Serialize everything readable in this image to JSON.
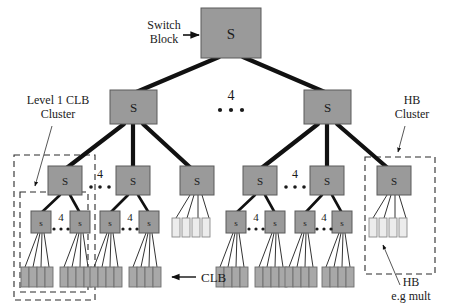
{
  "figure": {
    "background_color": "#ffffff",
    "colors": {
      "switch_block_fill": "#9a9a9a",
      "switch_block_stroke": "#5a5a5a",
      "clb_fill": "#a8a8a8",
      "clb_stroke": "#6e6e6e",
      "hb_fill": "#ececec",
      "hb_stroke": "#8a8a8a",
      "thick_edge": "#111111",
      "thin_edge": "#333333",
      "dashed_box": "#2b2b2b",
      "text": "#1a1a1a"
    }
  },
  "labels": {
    "switch_block": {
      "line1": "Switch",
      "line2": "Block"
    },
    "level1_cluster": {
      "line1": "Level 1 CLB",
      "line2": "Cluster"
    },
    "hb_cluster": {
      "line1": "HB",
      "line2": "Cluster"
    },
    "clb": "CLB",
    "hb_example": {
      "line1": "HB",
      "line2": "e.g mult"
    }
  },
  "fanout_annotations": [
    {
      "id": "root-fanout",
      "value": "4",
      "dots": "3",
      "level": "root-to-level2"
    },
    {
      "id": "l1-left-fanout",
      "value": "4",
      "dots": "3",
      "level": "level2-to-level1"
    },
    {
      "id": "l1-right-fanout",
      "value": "4",
      "dots": "3",
      "level": "level2-to-level1"
    },
    {
      "id": "leaf-c1-fanout",
      "value": "4",
      "dots": "3",
      "level": "level1-to-leaf"
    },
    {
      "id": "leaf-c2-fanout",
      "value": "4",
      "dots": "3",
      "level": "level1-to-leaf"
    },
    {
      "id": "leaf-c3-fanout",
      "value": "4",
      "dots": "3",
      "level": "level1-to-leaf"
    },
    {
      "id": "leaf-c4-fanout",
      "value": "4",
      "dots": "3",
      "level": "level1-to-leaf"
    }
  ],
  "nodes": {
    "switch_block_glyph": "S",
    "leaf_switch_glyph": "s",
    "root": {
      "id": "S-root",
      "glyph": "S"
    },
    "level2": [
      {
        "id": "S-L2-left",
        "glyph": "S"
      },
      {
        "id": "S-L2-right",
        "glyph": "S"
      }
    ],
    "level1": [
      {
        "id": "S-L1-1",
        "glyph": "S",
        "kind": "clb-cluster"
      },
      {
        "id": "S-L1-2",
        "glyph": "S",
        "kind": "clb-cluster"
      },
      {
        "id": "S-L1-3",
        "glyph": "S",
        "kind": "hb-cluster"
      },
      {
        "id": "S-L1-4",
        "glyph": "S",
        "kind": "clb-cluster"
      },
      {
        "id": "S-L1-5",
        "glyph": "S",
        "kind": "clb-cluster"
      },
      {
        "id": "S-L1-6",
        "glyph": "S",
        "kind": "hb-cluster"
      }
    ],
    "leaf_switches": [
      {
        "id": "s-1a",
        "glyph": "s"
      },
      {
        "id": "s-1b",
        "glyph": "s"
      },
      {
        "id": "s-2a",
        "glyph": "s"
      },
      {
        "id": "s-2b",
        "glyph": "s"
      },
      {
        "id": "s-4a",
        "glyph": "s"
      },
      {
        "id": "s-4b",
        "glyph": "s"
      },
      {
        "id": "s-5a",
        "glyph": "s"
      },
      {
        "id": "s-5b",
        "glyph": "s"
      }
    ],
    "clb_groups_count": 8,
    "clbs_per_group": 4,
    "hb_groups_count": 2,
    "hbs_per_group": 4
  },
  "dashed_regions": [
    {
      "id": "level1-clb-cluster-box",
      "label_ref": "level1_cluster"
    },
    {
      "id": "level1-clb-subcluster-box",
      "label_ref": null
    },
    {
      "id": "hb-cluster-box",
      "label_ref": "hb_cluster"
    }
  ]
}
